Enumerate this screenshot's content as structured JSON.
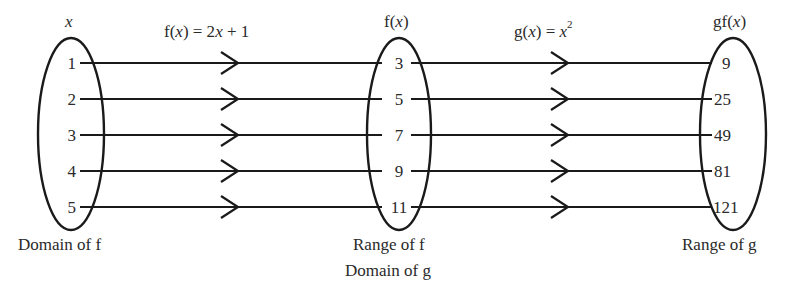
{
  "diagram": {
    "sets": [
      {
        "id": "x",
        "header": "x",
        "caption": [
          "Domain of f"
        ],
        "values": [
          "1",
          "2",
          "3",
          "4",
          "5"
        ]
      },
      {
        "id": "fx",
        "header": "f(x)",
        "caption": [
          "Range of f",
          "Domain of g"
        ],
        "values": [
          "3",
          "5",
          "7",
          "9",
          "11"
        ]
      },
      {
        "id": "gfx",
        "header": "gf(x)",
        "caption": [
          "Range of g"
        ],
        "values": [
          "9",
          "25",
          "49",
          "81",
          "121"
        ]
      }
    ],
    "mappings": [
      {
        "label_prefix": "f(",
        "label_var": "x",
        "label_mid": ") = 2",
        "label_var2": "x",
        "label_suffix": " + 1",
        "from": "x",
        "to": "fx"
      },
      {
        "label_prefix": "g(",
        "label_var": "x",
        "label_mid": ") = ",
        "label_var2": "x",
        "label_sup": "2",
        "from": "fx",
        "to": "gfx"
      }
    ],
    "colors": {
      "stroke": "#1a1a1a",
      "text": "#2a2a2a",
      "background": "#ffffff"
    }
  }
}
